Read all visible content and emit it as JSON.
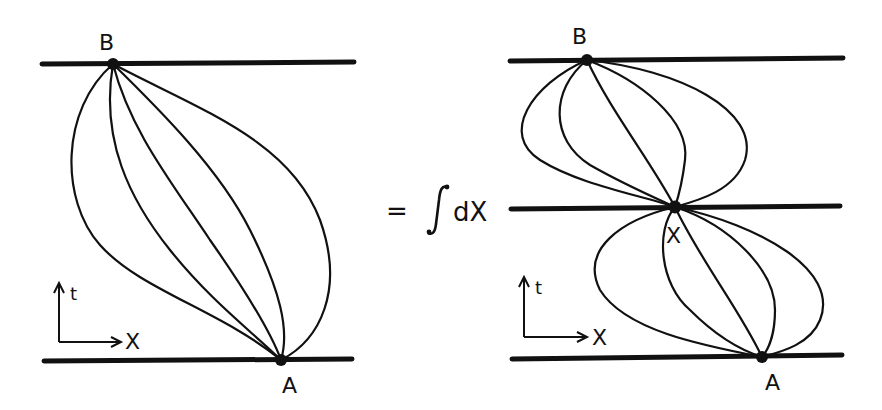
{
  "left_panel": {
    "point_top_label": "B",
    "point_bottom_label": "A",
    "axis_t_label": "t",
    "axis_x_label": "X"
  },
  "equation": {
    "equals": "=",
    "integral": "∫",
    "differential": "dX"
  },
  "right_panel": {
    "point_top_label": "B",
    "point_middle_label": "X",
    "point_bottom_label": "A",
    "axis_t_label": "t",
    "axis_x_label": "X"
  },
  "colors": {
    "ink": "#111111",
    "background": "#ffffff"
  }
}
